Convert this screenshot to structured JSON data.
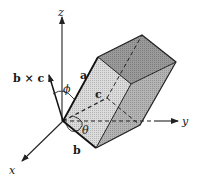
{
  "colors": {
    "background": "#ffffff",
    "line": "#222222",
    "face_front": "#dcdcdc",
    "face_top": "#9a9a9a",
    "face_right": "#b4b4b4"
  },
  "axes": {
    "x_label": "x",
    "y_label": "y",
    "z_label": "z"
  },
  "vectors": {
    "a_label": "a",
    "b_label": "b",
    "c_label": "c",
    "cross_label": "b × c"
  },
  "angles": {
    "phi_label": "ϕ",
    "theta_label": "θ"
  }
}
